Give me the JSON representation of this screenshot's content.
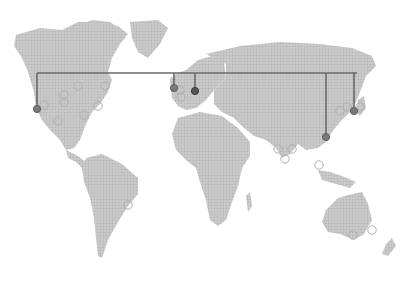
{
  "map": {
    "width": 415,
    "height": 281,
    "colors": {
      "land": "#c6c6c6",
      "land_dots": "#b4b4b4",
      "background": "#ffffff",
      "connector": "#6a6a6a",
      "marker_filled": "#7a7a7a",
      "marker_filled_dark": "#555555",
      "marker_hollow_stroke": "#b0b0b0"
    },
    "connector_line": {
      "y": 73,
      "x_start": 37,
      "x_end": 357
    },
    "connected_markers": [
      {
        "name": "us-west",
        "x": 37,
        "y": 109,
        "tone": "mid"
      },
      {
        "name": "uk",
        "x": 174,
        "y": 88,
        "tone": "mid"
      },
      {
        "name": "central-europe",
        "x": 195,
        "y": 91,
        "tone": "dark"
      },
      {
        "name": "hong-kong",
        "x": 326,
        "y": 137,
        "tone": "mid"
      },
      {
        "name": "japan",
        "x": 354,
        "y": 111,
        "tone": "mid"
      }
    ],
    "hollow_markers": [
      {
        "x": 44,
        "y": 105
      },
      {
        "x": 58,
        "y": 121
      },
      {
        "x": 64,
        "y": 95
      },
      {
        "x": 64,
        "y": 102
      },
      {
        "x": 78,
        "y": 86
      },
      {
        "x": 84,
        "y": 115
      },
      {
        "x": 98,
        "y": 106
      },
      {
        "x": 105,
        "y": 86
      },
      {
        "x": 180,
        "y": 90
      },
      {
        "x": 181,
        "y": 97
      },
      {
        "x": 340,
        "y": 111
      },
      {
        "x": 347,
        "y": 107
      },
      {
        "x": 360,
        "y": 107
      },
      {
        "x": 278,
        "y": 149
      },
      {
        "x": 292,
        "y": 149
      },
      {
        "x": 285,
        "y": 159
      },
      {
        "x": 319,
        "y": 165
      },
      {
        "x": 128,
        "y": 205
      },
      {
        "x": 353,
        "y": 235
      },
      {
        "x": 372,
        "y": 230
      }
    ]
  }
}
